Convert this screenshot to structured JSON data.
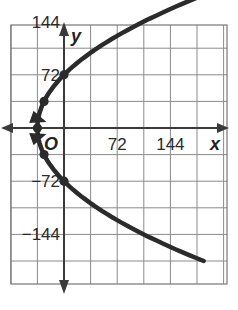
{
  "chart_data": {
    "type": "line",
    "title": "",
    "xlabel": "x",
    "ylabel": "y",
    "origin_label": "O",
    "xlim": [
      -72,
      216
    ],
    "ylim": [
      -216,
      180
    ],
    "grid": true,
    "grid_step": 36,
    "x_ticks": [
      {
        "value": 72,
        "label": "72"
      },
      {
        "value": 144,
        "label": "144"
      }
    ],
    "y_ticks": [
      {
        "value": 144,
        "label": "144"
      },
      {
        "value": 72,
        "label": "72"
      },
      {
        "value": -72,
        "label": "−72"
      },
      {
        "value": -144,
        "label": "−144"
      }
    ],
    "series": [
      {
        "name": "parabola",
        "equation": "x = y^2/144 - 36",
        "color": "#2b2b2b",
        "arrows": "both ends",
        "points": [
          {
            "x": -36,
            "y": 0
          },
          {
            "x": -27,
            "y": 36
          },
          {
            "x": 0,
            "y": 72
          },
          {
            "x": -27,
            "y": -36
          },
          {
            "x": 0,
            "y": -72
          }
        ]
      }
    ],
    "legend": "none"
  },
  "colors": {
    "curve": "#2b2b2b",
    "axis": "#3a3a3a",
    "grid": "#8a8a8a",
    "background": "#ffffff"
  }
}
